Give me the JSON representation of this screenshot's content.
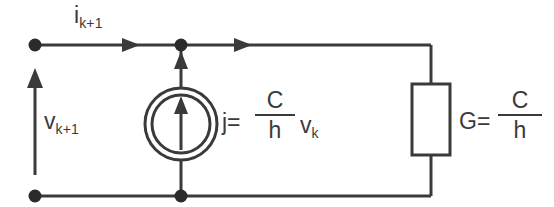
{
  "diagram": {
    "stroke_color": "#3a3a3a",
    "background_color": "#ffffff",
    "labels": {
      "current": {
        "symbol": "i",
        "subscript": "k+1"
      },
      "voltage": {
        "symbol": "v",
        "subscript": "k+1"
      },
      "source_prefix": "j=",
      "source_numerator": "C",
      "source_denominator": "h",
      "source_factor_symbol": "v",
      "source_factor_subscript": "k",
      "conductance_prefix": "G=",
      "conductance_numerator": "C",
      "conductance_denominator": "h"
    },
    "components": {
      "current_source": "double-circle-current-source",
      "resistor": "rectangular-resistor-box",
      "nodes": 4,
      "arrows": 3
    }
  }
}
